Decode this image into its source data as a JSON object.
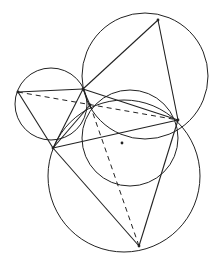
{
  "diagram": {
    "stroke": "#222222",
    "background": "#ffffff",
    "points": {
      "P": [
        18,
        92
      ],
      "A": [
        83,
        89
      ],
      "M": [
        90,
        105
      ],
      "T": [
        158,
        20
      ],
      "R": [
        178,
        120
      ],
      "C": [
        53,
        148
      ],
      "B": [
        139,
        246
      ],
      "N": [
        122,
        143
      ]
    },
    "circles": [
      {
        "name": "left-circle",
        "cx": 51,
        "cy": 104,
        "r": 36
      },
      {
        "name": "upper-right-circle",
        "cx": 145,
        "cy": 76,
        "r": 63
      },
      {
        "name": "middle-circle",
        "cx": 130,
        "cy": 138,
        "r": 48
      },
      {
        "name": "lower-circle",
        "cx": 124,
        "cy": 176,
        "r": 76
      }
    ],
    "solid_segments": [
      [
        "P",
        "A"
      ],
      [
        "P",
        "C"
      ],
      [
        "A",
        "C"
      ],
      [
        "A",
        "T"
      ],
      [
        "T",
        "R"
      ],
      [
        "A",
        "R"
      ],
      [
        "C",
        "R"
      ],
      [
        "C",
        "B"
      ],
      [
        "B",
        "R"
      ],
      [
        "A",
        "M"
      ],
      [
        "M",
        "C"
      ]
    ],
    "dashed_segments": [
      [
        "P",
        "R"
      ],
      [
        "M",
        "B"
      ]
    ]
  }
}
